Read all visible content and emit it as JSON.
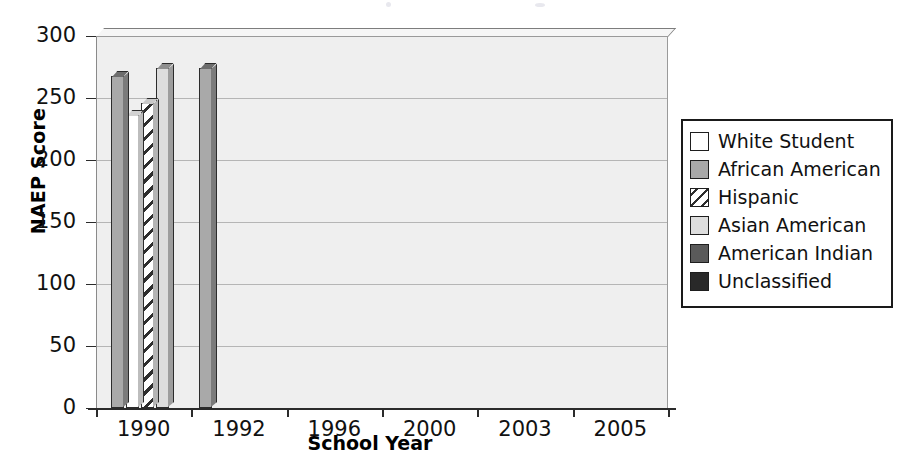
{
  "chart_data": {
    "type": "bar",
    "title": "",
    "subtitle": "",
    "xlabel": "School Year",
    "ylabel": "NAEP Score",
    "categories": [
      "1990",
      "1992",
      "1996",
      "2000",
      "2003",
      "2005"
    ],
    "ylim": [
      0,
      300
    ],
    "yticks": [
      0,
      50,
      100,
      150,
      200,
      250,
      300
    ],
    "ytick_labels": [
      "0",
      "50",
      "100",
      "150",
      "200",
      "250",
      "300"
    ],
    "grid": true,
    "legend_position": "right",
    "orientation": "vertical",
    "grouped": true,
    "style_note": "3D-style grouped column chart, grayscale fills with diagonal hatch for Hispanic",
    "series": [
      {
        "name": "White Student",
        "fill": "f-white",
        "swatch": "s-white",
        "color": "#ffffff",
        "values": [
          236,
          236,
          239,
          241,
          250,
          255
        ]
      },
      {
        "name": "African American",
        "fill": "f-afam",
        "swatch": "s-afam",
        "color": "#a9a9a9",
        "values": [
          268,
          274,
          278,
          282,
          287,
          287
        ]
      },
      {
        "name": "Hispanic",
        "fill": "f-hisp",
        "swatch": "s-hisp",
        "color": "#ffffff",
        "values": [
          246,
          248,
          249,
          252,
          255,
          256
        ]
      },
      {
        "name": "Asian American",
        "fill": "f-asian",
        "swatch": "s-asian",
        "color": "#dddddd",
        "values": [
          274,
          290,
          null,
          253,
          286,
          294
        ]
      },
      {
        "name": "American Indian",
        "fill": "f-amind",
        "swatch": "s-amind",
        "color": "#5a5a5a",
        "values": [
          null,
          null,
          null,
          264,
          264,
          265
        ]
      },
      {
        "name": "Unclassified",
        "fill": "f-unclass",
        "swatch": "s-unclass",
        "color": "#292929",
        "values": [
          null,
          257,
          null,
          null,
          277,
          280
        ]
      }
    ]
  },
  "legend": {
    "items": [
      {
        "label": "White Student",
        "swatch": "s-white"
      },
      {
        "label": "African American",
        "swatch": "s-afam"
      },
      {
        "label": "Hispanic",
        "swatch": "s-hisp"
      },
      {
        "label": "Asian American",
        "swatch": "s-asian"
      },
      {
        "label": "American Indian",
        "swatch": "s-amind"
      },
      {
        "label": "Unclassified",
        "swatch": "s-unclass"
      }
    ]
  }
}
